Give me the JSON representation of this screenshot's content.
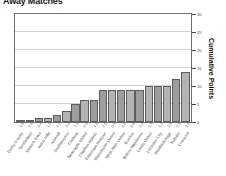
{
  "chart_data": {
    "type": "bar",
    "title": "Away Matches",
    "xlabel": "",
    "ylabel": "Cumulative Points",
    "ylim": [
      0,
      30
    ],
    "yticks": [
      0,
      5,
      10,
      15,
      20,
      25,
      30
    ],
    "grid": true,
    "legend": "none",
    "categories": [
      "Derby County",
      "Sunderland",
      "Ipswich Town",
      "Aston Villa",
      "Arsenal",
      "Southampton",
      "Chelsea",
      "Newcastle United",
      "Charlton Athletic",
      "Tottenham Hotspur",
      "Manchester United",
      "West Ham United",
      "Everton",
      "Bolton Wanderers",
      "Leeds United",
      "Leicester City",
      "Middlesbrough",
      "Fulham",
      "Liverpool"
    ],
    "values": [
      0,
      0,
      1,
      1,
      2,
      3,
      5,
      6,
      6,
      9,
      9,
      9,
      9,
      9,
      10,
      10,
      10,
      12,
      14
    ],
    "point_labels": [
      "1.0",
      "2.0",
      "0.4",
      "1.1",
      "0.2",
      "3.2",
      "2.1",
      "0.3",
      "1.3",
      "2.0",
      "0.1",
      "0.2",
      "0.8",
      "0.2",
      "1.1",
      "1.2",
      "1.5",
      "0.1",
      "2.1"
    ],
    "bar_tones": [
      0,
      1,
      0,
      1,
      0,
      1,
      0,
      1,
      0,
      0,
      1,
      0,
      1,
      0,
      1,
      0,
      1,
      0,
      1
    ]
  }
}
